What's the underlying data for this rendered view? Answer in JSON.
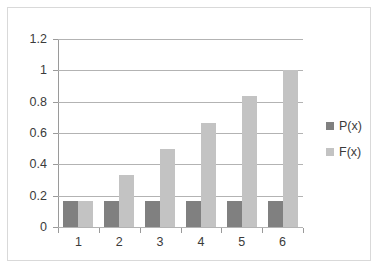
{
  "chart_data": {
    "type": "bar",
    "title": "",
    "subtitle": "",
    "xlabel": "",
    "ylabel": "",
    "categories": [
      "1",
      "2",
      "3",
      "4",
      "5",
      "6"
    ],
    "series": [
      {
        "name": "P(x)",
        "color": "#808080",
        "values": [
          0.167,
          0.167,
          0.167,
          0.167,
          0.167,
          0.167
        ]
      },
      {
        "name": "F(x)",
        "color": "#c3c3c3",
        "values": [
          0.167,
          0.333,
          0.5,
          0.667,
          0.833,
          1.0
        ]
      }
    ],
    "ylim": [
      0,
      1.2
    ],
    "yticks": [
      0,
      0.2,
      0.4,
      0.6,
      0.8,
      1,
      1.2
    ],
    "ytick_labels": [
      "0",
      "0.2",
      "0.4",
      "0.6",
      "0.8",
      "1",
      "1.2"
    ],
    "grid": true,
    "legend_position": "right",
    "legend": [
      "P(x)",
      "F(x)"
    ]
  },
  "chart": {
    "border_color": "#d9d9d9",
    "gridline_color": "#b3b3b3",
    "axis_color": "#9a9a9a",
    "text_color": "#3b3b3b",
    "background": "#ffffff"
  }
}
